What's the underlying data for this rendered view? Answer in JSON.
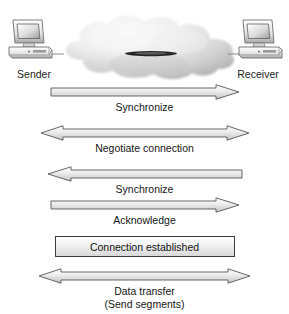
{
  "diagram": {
    "endpoints": [
      {
        "id": "sender",
        "label": "Sender",
        "icon": "desktop-computer-icon"
      },
      {
        "id": "receiver",
        "label": "Receiver",
        "icon": "desktop-computer-icon"
      }
    ],
    "network": {
      "icon": "network-cloud-icon",
      "label": ""
    },
    "steps": [
      {
        "id": "synchronize-1",
        "label": "Synchronize",
        "direction": "right",
        "arrow_icon": "arrow-right-icon"
      },
      {
        "id": "negotiate-connection",
        "label": "Negotiate connection",
        "direction": "both",
        "arrow_icon": "arrow-left-right-icon"
      },
      {
        "id": "synchronize-2",
        "label": "Synchronize",
        "direction": "left",
        "arrow_icon": "arrow-left-icon"
      },
      {
        "id": "acknowledge",
        "label": "Acknowledge",
        "direction": "right",
        "arrow_icon": "arrow-right-icon"
      }
    ],
    "status": {
      "id": "connection-established",
      "label": "Connection established"
    },
    "data_transfer": {
      "id": "data-transfer",
      "label_line1": "Data transfer",
      "label_line2": "(Send segments)",
      "direction": "both",
      "arrow_icon": "arrow-left-right-icon"
    },
    "colors": {
      "arrow_outline": "#4a4a4a",
      "arrow_fill_light": "#ffffff",
      "arrow_fill_dark": "#c9c9c9",
      "cloud_light": "#fbfbfb",
      "cloud_dark": "#b9b9b9",
      "text": "#151515",
      "link_line": "#111111"
    }
  }
}
